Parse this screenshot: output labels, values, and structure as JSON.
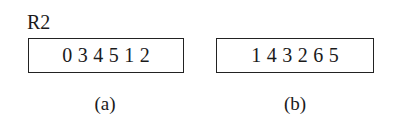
{
  "register_label": "R2",
  "panels": [
    {
      "caption": "(a)",
      "values": [
        "0",
        "3",
        "4",
        "5",
        "1",
        "2"
      ]
    },
    {
      "caption": "(b)",
      "values": [
        "1",
        "4",
        "3",
        "2",
        "6",
        "5"
      ]
    }
  ]
}
